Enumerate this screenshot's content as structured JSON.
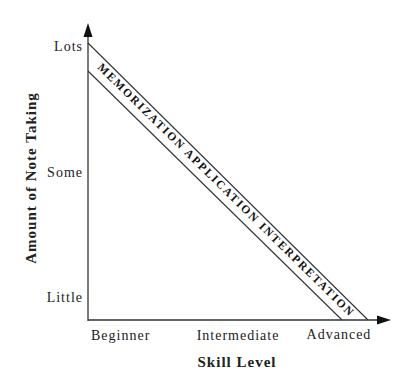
{
  "diagram": {
    "type": "skill-vs-notetaking",
    "y_axis": {
      "title": "Amount of Note Taking",
      "ticks": [
        "Lots",
        "Some",
        "Little"
      ]
    },
    "x_axis": {
      "title": "Skill Level",
      "ticks": [
        "Beginner",
        "Intermediate",
        "Advanced"
      ]
    },
    "band": {
      "label": "MEMORIZATION APPLICATION INTERPRETATION",
      "stages": [
        "MEMORIZATION",
        "APPLICATION",
        "INTERPRETATION"
      ]
    },
    "colors": {
      "line": "#333333",
      "text": "#222222",
      "background": "#ffffff"
    }
  }
}
